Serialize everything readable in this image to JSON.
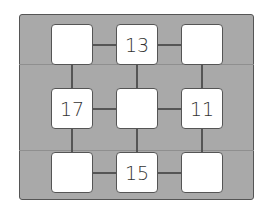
{
  "puzzle": {
    "description": "3x3 number grid puzzle on a wooden board",
    "cells": [
      {
        "row": 0,
        "col": 0,
        "value": ""
      },
      {
        "row": 0,
        "col": 1,
        "value": "13"
      },
      {
        "row": 0,
        "col": 2,
        "value": ""
      },
      {
        "row": 1,
        "col": 0,
        "value": "17"
      },
      {
        "row": 1,
        "col": 1,
        "value": ""
      },
      {
        "row": 1,
        "col": 2,
        "value": "11"
      },
      {
        "row": 2,
        "col": 0,
        "value": ""
      },
      {
        "row": 2,
        "col": 1,
        "value": "15"
      },
      {
        "row": 2,
        "col": 2,
        "value": ""
      }
    ]
  },
  "colors": {
    "board": "#a9a9a9",
    "border": "#555555",
    "cell": "#ffffff"
  }
}
